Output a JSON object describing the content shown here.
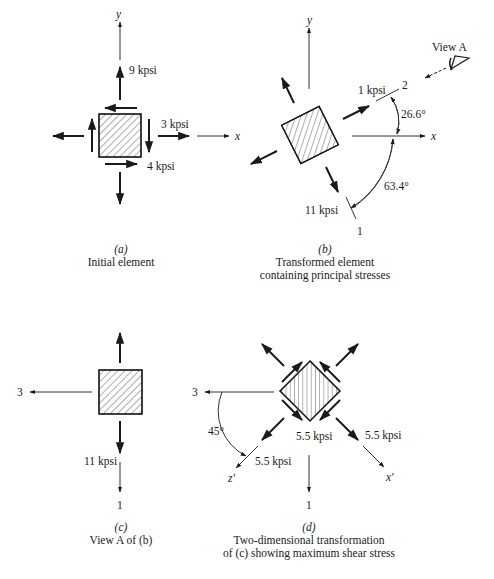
{
  "figure": {
    "panels": [
      {
        "id": "a",
        "caption_label": "(a)",
        "caption_text": [
          "Initial element"
        ],
        "axis_labels": {
          "x": "x",
          "y": "y"
        },
        "stress_labels": {
          "sigma_y": "9 kpsi",
          "sigma_x": "3 kpsi",
          "tau_xy": "4 kpsi"
        }
      },
      {
        "id": "b",
        "caption_label": "(b)",
        "caption_text": [
          "Transformed element",
          "containing principal stresses"
        ],
        "axis_labels": {
          "x": "x",
          "y": "y",
          "principal_1": "1",
          "principal_2": "2"
        },
        "stress_labels": {
          "sigma_1": "11 kpsi",
          "sigma_2": "1 kpsi"
        },
        "angles": {
          "to_axis_2": "26.6°",
          "to_axis_1": "63.4°"
        },
        "view_label": "View A"
      },
      {
        "id": "c",
        "caption_label": "(c)",
        "caption_text": [
          "View A of (b)"
        ],
        "axis_labels": {
          "principal_3": "3",
          "principal_1": "1"
        },
        "stress_labels": {
          "sigma_1": "11 kpsi"
        }
      },
      {
        "id": "d",
        "caption_label": "(d)",
        "caption_text": [
          "Two-dimensional transformation",
          "of (c) showing maximum shear stress"
        ],
        "axis_labels": {
          "principal_3": "3",
          "principal_1": "1",
          "z_prime": "z′",
          "x_prime": "x′"
        },
        "stress_labels": {
          "normal_left": "5.5 kpsi",
          "shear": "5.5 kpsi",
          "normal_right": "5.5 kpsi"
        },
        "angles": {
          "rotation": "45°"
        }
      }
    ]
  }
}
